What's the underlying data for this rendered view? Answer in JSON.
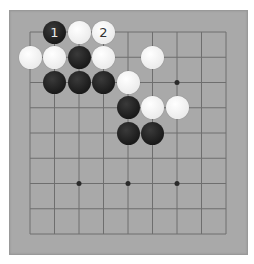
{
  "board": {
    "size": 9,
    "background_color": "#a9a9a9",
    "line_color": "#6e6e6e",
    "origin_x": 30,
    "origin_y": 32,
    "spacing_x": 24.5,
    "spacing_y": 25.25,
    "star_points": [
      [
        2,
        6
      ],
      [
        4,
        6
      ],
      [
        6,
        6
      ],
      [
        6,
        2
      ],
      [
        2,
        2
      ],
      [
        4,
        4
      ]
    ],
    "visible_star_points": [
      [
        6,
        2
      ],
      [
        2,
        6
      ],
      [
        4,
        6
      ],
      [
        6,
        6
      ]
    ]
  },
  "stones": [
    {
      "color": "black",
      "col": 1,
      "row": 0,
      "label": "1"
    },
    {
      "color": "white",
      "col": 2,
      "row": 0,
      "label": ""
    },
    {
      "color": "white",
      "col": 3,
      "row": 0,
      "label": "2"
    },
    {
      "color": "white",
      "col": 0,
      "row": 1,
      "label": ""
    },
    {
      "color": "white",
      "col": 1,
      "row": 1,
      "label": ""
    },
    {
      "color": "black",
      "col": 2,
      "row": 1,
      "label": ""
    },
    {
      "color": "white",
      "col": 3,
      "row": 1,
      "label": ""
    },
    {
      "color": "white",
      "col": 5,
      "row": 1,
      "label": ""
    },
    {
      "color": "black",
      "col": 1,
      "row": 2,
      "label": ""
    },
    {
      "color": "black",
      "col": 2,
      "row": 2,
      "label": ""
    },
    {
      "color": "black",
      "col": 3,
      "row": 2,
      "label": ""
    },
    {
      "color": "white",
      "col": 4,
      "row": 2,
      "label": ""
    },
    {
      "color": "black",
      "col": 4,
      "row": 3,
      "label": ""
    },
    {
      "color": "white",
      "col": 5,
      "row": 3,
      "label": ""
    },
    {
      "color": "white",
      "col": 6,
      "row": 3,
      "label": ""
    },
    {
      "color": "black",
      "col": 4,
      "row": 4,
      "label": ""
    },
    {
      "color": "black",
      "col": 5,
      "row": 4,
      "label": ""
    }
  ]
}
